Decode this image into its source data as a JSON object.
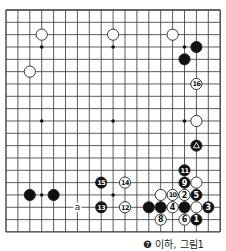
{
  "board": {
    "size": 19,
    "origin_x": 6,
    "origin_y": 10,
    "spacing_x": 11.9,
    "spacing_y": 12.33,
    "stone_radius": 5.6,
    "line_color": "#333333",
    "black_color": "#111111",
    "white_color": "#ffffff",
    "star_points": [
      [
        3,
        3
      ],
      [
        9,
        3
      ],
      [
        15,
        3
      ],
      [
        3,
        9
      ],
      [
        9,
        9
      ],
      [
        15,
        9
      ],
      [
        3,
        15
      ],
      [
        9,
        15
      ],
      [
        15,
        15
      ]
    ]
  },
  "stones": [
    {
      "color": "white",
      "col": 3,
      "row": 2,
      "label": ""
    },
    {
      "color": "white",
      "col": 9,
      "row": 2,
      "label": ""
    },
    {
      "color": "white",
      "col": 2,
      "row": 5,
      "label": ""
    },
    {
      "color": "white",
      "col": 14,
      "row": 2,
      "label": ""
    },
    {
      "color": "black",
      "col": 16,
      "row": 3,
      "label": ""
    },
    {
      "color": "black",
      "col": 15,
      "row": 4,
      "label": ""
    },
    {
      "color": "white",
      "col": 16,
      "row": 6,
      "label": "16"
    },
    {
      "color": "white",
      "col": 16,
      "row": 9,
      "label": ""
    },
    {
      "color": "black",
      "col": 16,
      "row": 11,
      "label": "△"
    },
    {
      "color": "black",
      "col": 15,
      "row": 13,
      "label": "11"
    },
    {
      "color": "black",
      "col": 15,
      "row": 14,
      "label": "9"
    },
    {
      "color": "white",
      "col": 16,
      "row": 14,
      "label": ""
    },
    {
      "color": "white",
      "col": 13,
      "row": 15,
      "label": ""
    },
    {
      "color": "white",
      "col": 14,
      "row": 15,
      "label": "10"
    },
    {
      "color": "white",
      "col": 15,
      "row": 15,
      "label": "2"
    },
    {
      "color": "black",
      "col": 16,
      "row": 15,
      "label": "5"
    },
    {
      "color": "black",
      "col": 12,
      "row": 16,
      "label": ""
    },
    {
      "color": "black",
      "col": 13,
      "row": 16,
      "label": ""
    },
    {
      "color": "white",
      "col": 14,
      "row": 16,
      "label": "4"
    },
    {
      "color": "black",
      "col": 15,
      "row": 16,
      "label": ""
    },
    {
      "color": "white",
      "col": 16,
      "row": 16,
      "label": ""
    },
    {
      "color": "black",
      "col": 17,
      "row": 16,
      "label": "3"
    },
    {
      "color": "white",
      "col": 13,
      "row": 17,
      "label": "8"
    },
    {
      "color": "white",
      "col": 15,
      "row": 17,
      "label": "6"
    },
    {
      "color": "black",
      "col": 16,
      "row": 17,
      "label": "1"
    },
    {
      "color": "black",
      "col": 2,
      "row": 15,
      "label": ""
    },
    {
      "color": "black",
      "col": 4,
      "row": 15,
      "label": ""
    },
    {
      "color": "black",
      "col": 8,
      "row": 14,
      "label": "15"
    },
    {
      "color": "white",
      "col": 10,
      "row": 14,
      "label": "14"
    },
    {
      "color": "black",
      "col": 8,
      "row": 16,
      "label": "13"
    },
    {
      "color": "white",
      "col": 10,
      "row": 16,
      "label": "12"
    }
  ],
  "markers": [
    {
      "text": "a",
      "col": 6,
      "row": 16
    }
  ],
  "caption": "❼ 이하, 그림1"
}
